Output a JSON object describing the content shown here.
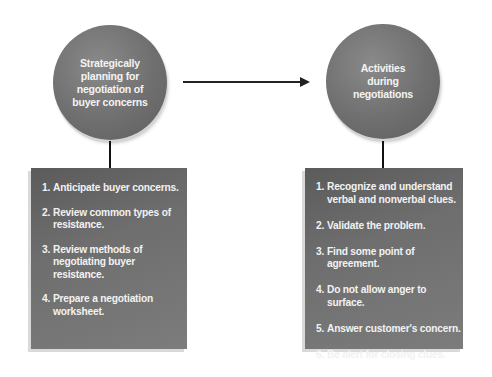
{
  "diagram": {
    "left": {
      "circle_label": "Strategically planning for negotiation of buyer concerns",
      "items": [
        {
          "num": "1.",
          "text": "Anticipate buyer concerns."
        },
        {
          "num": "2.",
          "text": "Review common types of resistance."
        },
        {
          "num": "3.",
          "text": "Review methods of negotiating buyer resistance."
        },
        {
          "num": "4.",
          "text": "Prepare a negotiation worksheet."
        }
      ]
    },
    "right": {
      "circle_label": "Activities during negotiations",
      "items": [
        {
          "num": "1.",
          "text": "Recognize and understand verbal and nonverbal clues."
        },
        {
          "num": "2.",
          "text": "Validate the problem."
        },
        {
          "num": "3.",
          "text": "Find some point of agreement."
        },
        {
          "num": "4.",
          "text": "Do not allow anger to surface."
        },
        {
          "num": "5.",
          "text": "Answer customer's concern."
        },
        {
          "num": "6.",
          "text": "Be alert for closing clues."
        }
      ]
    },
    "connector": "arrow from left circle to right circle",
    "colors": {
      "shape_fill": "#6f6f6f",
      "text": "#f2f2f2",
      "lines": "#111111"
    }
  }
}
